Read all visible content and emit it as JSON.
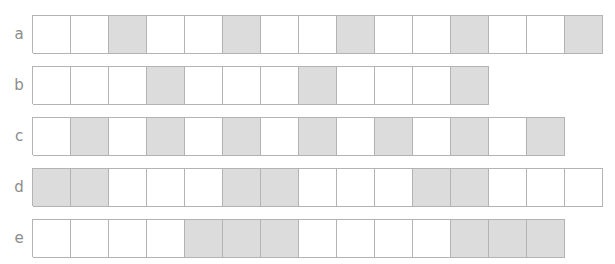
{
  "figure": {
    "type": "fraction-strip-diagram",
    "cell_width_px": 38,
    "cell_height_px": 38,
    "colors": {
      "shaded_fill": "#dcdcdc",
      "unshaded_fill": "#ffffff",
      "cell_border": "#b3b3b3",
      "label_text": "#8c8c8c"
    }
  },
  "rows": [
    {
      "label": "a",
      "total_cells": 15,
      "shaded_positions": [
        3,
        6,
        9,
        12,
        15
      ],
      "shaded_count": 5,
      "pattern_period": 3,
      "cells": [
        false,
        false,
        true,
        false,
        false,
        true,
        false,
        false,
        true,
        false,
        false,
        true,
        false,
        false,
        true
      ]
    },
    {
      "label": "b",
      "total_cells": 12,
      "shaded_positions": [
        4,
        8,
        12
      ],
      "shaded_count": 3,
      "pattern_period": 4,
      "cells": [
        false,
        false,
        false,
        true,
        false,
        false,
        false,
        true,
        false,
        false,
        false,
        true
      ]
    },
    {
      "label": "c",
      "total_cells": 14,
      "shaded_positions": [
        2,
        4,
        6,
        8,
        10,
        12,
        14
      ],
      "shaded_count": 7,
      "pattern_period": 2,
      "cells": [
        false,
        true,
        false,
        true,
        false,
        true,
        false,
        true,
        false,
        true,
        false,
        true,
        false,
        true
      ]
    },
    {
      "label": "d",
      "total_cells": 15,
      "shaded_positions": [
        1,
        2,
        6,
        7,
        11,
        12
      ],
      "shaded_count": 6,
      "pattern_period": 5,
      "cells": [
        true,
        true,
        false,
        false,
        false,
        true,
        true,
        false,
        false,
        false,
        true,
        true,
        false,
        false,
        false
      ]
    },
    {
      "label": "e",
      "total_cells": 14,
      "shaded_positions": [
        5,
        6,
        7,
        12,
        13,
        14
      ],
      "shaded_count": 6,
      "pattern_period": 7,
      "cells": [
        false,
        false,
        false,
        false,
        true,
        true,
        true,
        false,
        false,
        false,
        false,
        true,
        true,
        true
      ]
    }
  ]
}
